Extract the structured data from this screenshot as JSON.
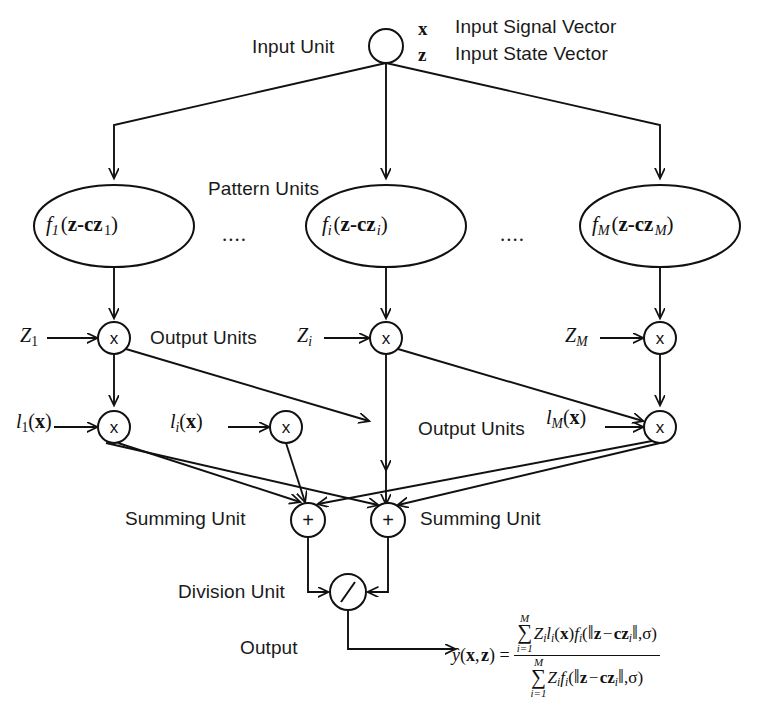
{
  "diagram": {
    "type": "neural-network-architecture",
    "stroke_color": "#111111",
    "background": "#ffffff"
  },
  "labels": {
    "input_unit": "Input Unit",
    "input_signal_vector": "Input Signal Vector",
    "input_state_vector": "Input State Vector",
    "pattern_units": "Pattern Units",
    "output_units_row1": "Output Units",
    "output_units_row2": "Output Units",
    "summing_unit_left": "Summing Unit",
    "summing_unit_right": "Summing Unit",
    "division_unit": "Division Unit",
    "output": "Output",
    "ellipsis_left": "....",
    "ellipsis_right": "...."
  },
  "input_node": {
    "signal_symbol": "x",
    "state_symbol": "z"
  },
  "pattern_units": [
    {
      "id": "p1",
      "func": "f",
      "index": "1",
      "arg_prefix": "z-cz",
      "arg_index": "1"
    },
    {
      "id": "pi",
      "func": "f",
      "index": "i",
      "arg_prefix": "z-cz",
      "arg_index": "i"
    },
    {
      "id": "pM",
      "func": "f",
      "index": "M",
      "arg_prefix": "z-cz",
      "arg_index": "M"
    }
  ],
  "weight_labels_row1": [
    {
      "symbol": "Z",
      "index": "1"
    },
    {
      "symbol": "Z",
      "index": "i"
    },
    {
      "symbol": "Z",
      "index": "M"
    }
  ],
  "weight_labels_row2": [
    {
      "symbol": "l",
      "index": "1",
      "arg": "x"
    },
    {
      "symbol": "l",
      "index": "i",
      "arg": "x"
    },
    {
      "symbol": "l",
      "index": "M",
      "arg": "x"
    }
  ],
  "operators": {
    "multiply": "x",
    "sum": "+",
    "divide": "/"
  },
  "formula": {
    "lhs": "ŷ(x, z) =",
    "numerator": {
      "sum_upper": "M",
      "sum_lower": "i=1",
      "body": "Z_i l_i(x) f_i( ||z - cz_i||, σ )"
    },
    "denominator": {
      "sum_upper": "M",
      "sum_lower": "i=1",
      "body": "Z_i f_i( ||z - cz_i||, σ )"
    }
  }
}
